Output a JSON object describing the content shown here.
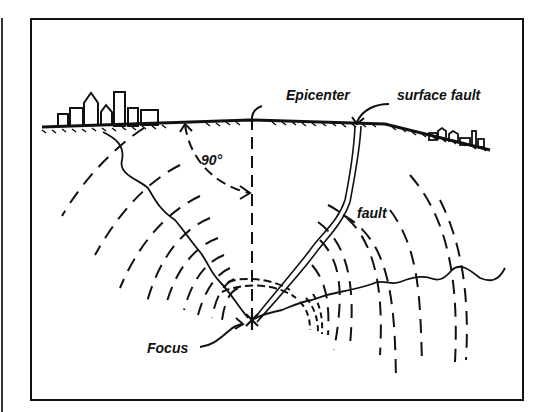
{
  "diagram": {
    "type": "earthquake-cross-section",
    "labels": {
      "epicenter": "Epicenter",
      "surface_fault": "surface fault",
      "fault": "fault",
      "focus": "Focus",
      "angle": "90°"
    },
    "elements": [
      "ground-surface",
      "city-skyline-left",
      "buildings-right",
      "fault-line",
      "seismic-wavefronts",
      "seismic-ray-paths",
      "vertical-epicenter-line",
      "right-angle-arc"
    ],
    "colors": {
      "ink": "#111111",
      "background": "#ffffff"
    }
  }
}
